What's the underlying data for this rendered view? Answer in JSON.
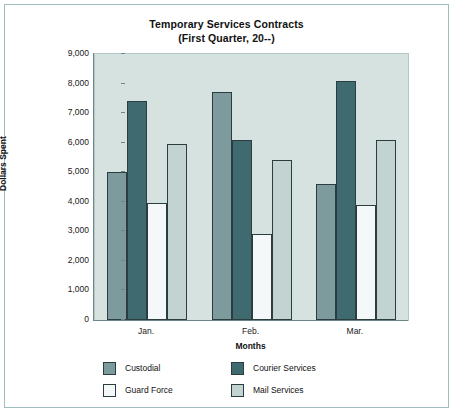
{
  "chart_data": {
    "type": "bar",
    "title": "Temporary Services Contracts",
    "subtitle": "(First Quarter, 20--)",
    "xlabel": "Months",
    "ylabel": "Dollars Spent",
    "categories": [
      "Jan.",
      "Feb.",
      "Mar."
    ],
    "ylim": [
      0,
      9000
    ],
    "ytick_step": 1000,
    "ytick_labels": [
      "9,000",
      "8,000",
      "7,000",
      "6,000",
      "5,000",
      "4,000",
      "3,000",
      "2,000",
      "1,000",
      "0"
    ],
    "ytick_values": [
      9000,
      8000,
      7000,
      6000,
      5000,
      4000,
      3000,
      2000,
      1000,
      0
    ],
    "grid": false,
    "legend_position": "bottom",
    "plot_background": "#d5e2e0",
    "series": [
      {
        "name": "Custodial",
        "color": "#7d9a9c",
        "values": [
          5000,
          7700,
          4600
        ]
      },
      {
        "name": "Courier Services",
        "color": "#3f6a70",
        "values": [
          7400,
          6100,
          8100
        ]
      },
      {
        "name": "Guard Force",
        "color": "#f4f8f8",
        "values": [
          3950,
          2900,
          3900
        ]
      },
      {
        "name": "Mail Services",
        "color": "#c3d3d2",
        "values": [
          5950,
          5400,
          6100
        ]
      }
    ]
  },
  "figure": {
    "border_color": "#9fbcbe",
    "background": "#ffffff"
  }
}
